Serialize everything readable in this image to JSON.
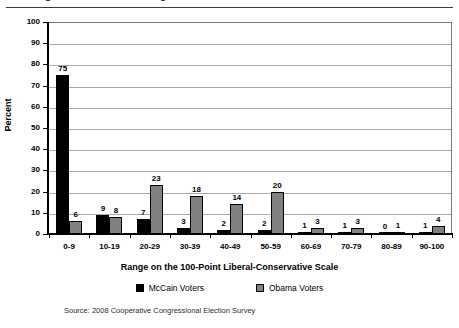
{
  "top_partial_title": "Figure 3. Perceived Ideological Position of the Presidential Candidates",
  "chart_data": {
    "type": "bar",
    "title": "",
    "xlabel": "Range on the 100-Point Liberal-Conservative Scale",
    "ylabel": "Percent",
    "ylim": [
      0,
      100
    ],
    "ytick_step": 10,
    "yticks": [
      0,
      10,
      20,
      30,
      40,
      50,
      60,
      70,
      80,
      90,
      100
    ],
    "grid": true,
    "legend_position": "bottom",
    "categories": [
      "0-9",
      "10-19",
      "20-29",
      "30-39",
      "40-49",
      "50-59",
      "60-69",
      "70-79",
      "80-89",
      "90-100"
    ],
    "series": [
      {
        "name": "McCain Voters",
        "color": "#000000",
        "values": [
          75,
          9,
          7,
          3,
          2,
          2,
          1,
          1,
          0,
          1
        ]
      },
      {
        "name": "Obama Voters",
        "color": "#808080",
        "values": [
          6,
          8,
          23,
          18,
          14,
          20,
          3,
          3,
          1,
          4
        ]
      }
    ],
    "source_note": "Source: 2008 Cooperative Congressional Election Survey"
  },
  "legend": [
    {
      "label": "McCain Voters",
      "swatch": "black"
    },
    {
      "label": "Obama Voters",
      "swatch": "gray"
    }
  ]
}
